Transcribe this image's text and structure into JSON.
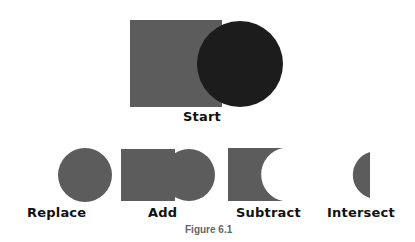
{
  "colors": {
    "shape_gray": "#5c5c5c",
    "shape_dark": "#1c1c1c",
    "label": "#111111",
    "caption": "#666666",
    "background": "#ffffff"
  },
  "start": {
    "label": "Start",
    "shapes": [
      "square",
      "circle"
    ]
  },
  "operations": [
    {
      "label": "Replace",
      "result": "circle"
    },
    {
      "label": "Add",
      "result": "square-plus-circle"
    },
    {
      "label": "Subtract",
      "result": "square-minus-circle"
    },
    {
      "label": "Intersect",
      "result": "lens"
    }
  ],
  "caption": "Figure 6.1"
}
